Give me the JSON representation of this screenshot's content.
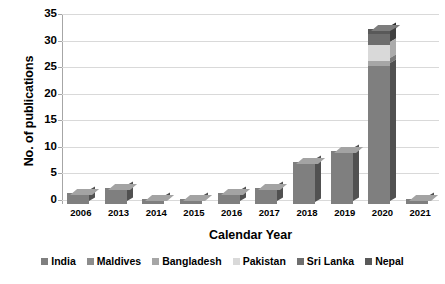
{
  "chart_data": {
    "type": "bar",
    "subtype": "stacked-3d-column",
    "title": "",
    "xlabel": "Calendar Year",
    "ylabel": "No. of publications",
    "categories": [
      "2006",
      "2013",
      "2014",
      "2015",
      "2016",
      "2017",
      "2018",
      "2019",
      "2020",
      "2021"
    ],
    "ylim": [
      0,
      35
    ],
    "ytick_labels": [
      "0",
      "5",
      "10",
      "15",
      "20",
      "25",
      "30",
      "35"
    ],
    "ytick_values": [
      0,
      5,
      10,
      15,
      20,
      25,
      30,
      35
    ],
    "grid": true,
    "legend_position": "bottom",
    "series": [
      {
        "name": "India",
        "color": "#7f7f7f",
        "values": [
          2,
          3,
          1,
          1,
          2,
          3,
          8,
          10,
          26,
          1
        ]
      },
      {
        "name": "Maldives",
        "color": "#8c8c8c",
        "values": [
          0,
          0,
          0,
          0,
          0,
          0,
          0,
          0,
          0,
          0
        ]
      },
      {
        "name": "Bangladesh",
        "color": "#a6a6a6",
        "values": [
          0,
          0,
          0,
          0,
          0,
          0,
          0,
          0,
          1,
          0
        ]
      },
      {
        "name": "Pakistan",
        "color": "#d9d9d9",
        "values": [
          0,
          0,
          0,
          0,
          0,
          0,
          0,
          0,
          3,
          0
        ]
      },
      {
        "name": "Sri Lanka",
        "color": "#6e6e6e",
        "values": [
          0,
          0,
          0,
          0,
          0,
          0,
          0,
          0,
          2,
          0
        ]
      },
      {
        "name": "Nepal",
        "color": "#595959",
        "values": [
          0,
          0,
          0,
          0,
          0,
          0,
          0,
          0,
          1,
          0
        ]
      }
    ],
    "totals": [
      2,
      3,
      1,
      1,
      2,
      3,
      8,
      10,
      33,
      1
    ]
  },
  "axes": {
    "y_title": "No. of publications",
    "x_title": "Calendar Year",
    "y_ticks": [
      {
        "label": "35",
        "value": 35
      },
      {
        "label": "30",
        "value": 30
      },
      {
        "label": "25",
        "value": 25
      },
      {
        "label": "20",
        "value": 20
      },
      {
        "label": "15",
        "value": 15
      },
      {
        "label": "10",
        "value": 10
      },
      {
        "label": "5",
        "value": 5
      },
      {
        "label": "0",
        "value": 0
      }
    ],
    "x_ticks": [
      "2006",
      "2013",
      "2014",
      "2015",
      "2016",
      "2017",
      "2018",
      "2019",
      "2020",
      "2021"
    ]
  },
  "legend": {
    "items": [
      {
        "label": "India",
        "color": "#7f7f7f"
      },
      {
        "label": "Maldives",
        "color": "#8c8c8c"
      },
      {
        "label": "Bangladesh",
        "color": "#a6a6a6"
      },
      {
        "label": "Pakistan",
        "color": "#d9d9d9"
      },
      {
        "label": "Sri Lanka",
        "color": "#6e6e6e"
      },
      {
        "label": "Nepal",
        "color": "#595959"
      }
    ]
  },
  "colors": {
    "background": "#ffffff",
    "grid": "#d9d9d9",
    "axis": "#a6a6a6",
    "text": "#000000"
  }
}
